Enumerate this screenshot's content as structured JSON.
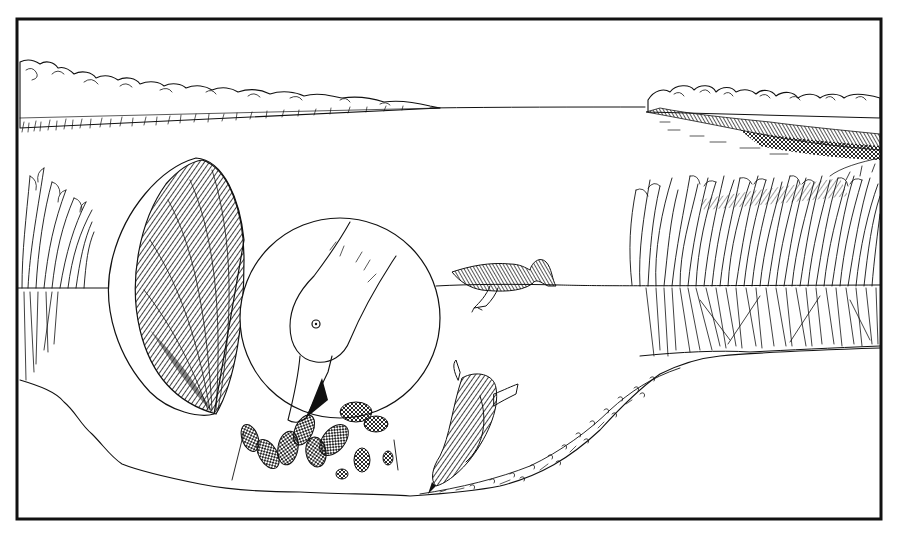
{
  "illustration": {
    "style": "black-and-white pen-and-ink drawing",
    "colors": {
      "ink": "#111111",
      "paper": "#ffffff"
    },
    "frame": {
      "x": 16,
      "y": 18,
      "width": 866,
      "height": 502
    },
    "elements": [
      "far-shore-treeline-left",
      "far-shore-treeline-right",
      "reed-bed-right",
      "reeds-left",
      "water-surface-line",
      "lake-bottom-profile",
      "swimming-duck",
      "diving-duck",
      "clam-shell-enlarged",
      "inset-circle-duck-feeding-on-mussels",
      "mussel-cluster"
    ],
    "text": []
  }
}
